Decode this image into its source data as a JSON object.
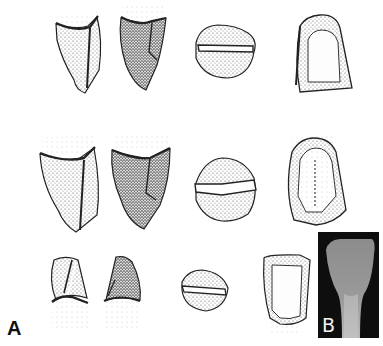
{
  "figure": {
    "panels": [
      {
        "id": "A",
        "label": "A",
        "description": "Line-drawn dental illustrations: three rows of tooth views (two lateral/proximal views, incisal view, labial/lingual view)"
      },
      {
        "id": "B",
        "label": "B",
        "description": "Radiograph of a tooth crown"
      }
    ],
    "rows": [
      {
        "name": "row-1",
        "views": [
          "mesial-view",
          "distal-view",
          "incisal-view",
          "lingual-view"
        ]
      },
      {
        "name": "row-2",
        "views": [
          "mesial-view",
          "distal-view",
          "incisal-view",
          "lingual-view"
        ]
      },
      {
        "name": "row-3",
        "views": [
          "mesial-view",
          "distal-view",
          "incisal-view",
          "labial-view"
        ]
      }
    ],
    "colors": {
      "ink": "#1a1a1a",
      "background": "#ffffff",
      "xray_background": "#0e0e0e",
      "xray_tooth": "#8a8a8a"
    }
  }
}
